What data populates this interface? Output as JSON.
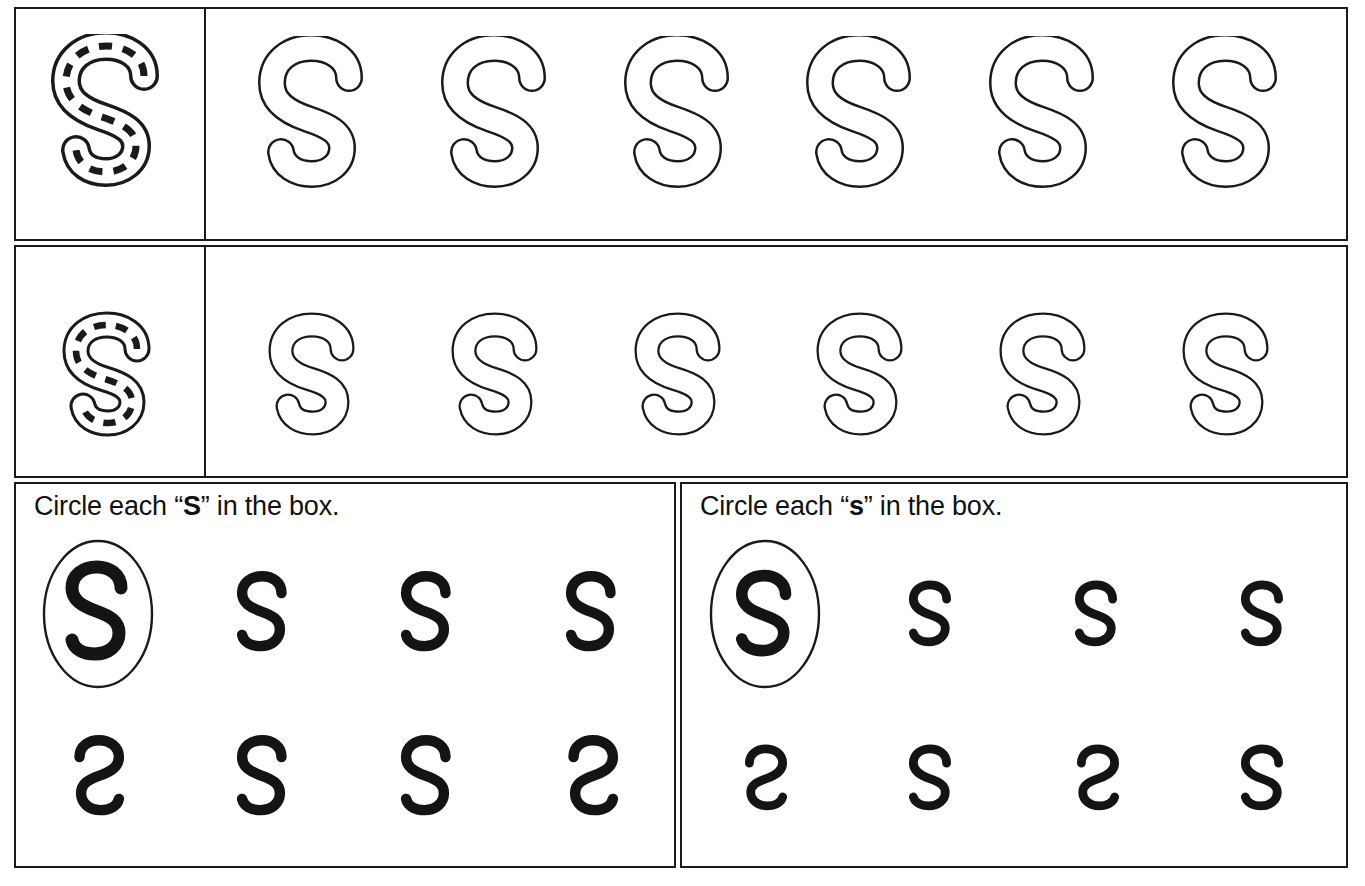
{
  "worksheet": {
    "letter_upper": "S",
    "letter_lower": "s",
    "ink_color": "#1a1a1a",
    "paper_color": "#ffffff"
  },
  "trace_rows": [
    {
      "name": "uppercase-trace-row",
      "case": "uppercase",
      "model": {
        "glyph": "S",
        "style": "dashed-guide-outline"
      },
      "practice_count": 6,
      "practice_glyph": "S",
      "practice_style": "outline"
    },
    {
      "name": "lowercase-trace-row",
      "case": "lowercase",
      "model": {
        "glyph": "s",
        "style": "dashed-guide-outline"
      },
      "practice_count": 6,
      "practice_glyph": "s",
      "practice_style": "outline"
    }
  ],
  "exercises": [
    {
      "name": "uppercase-find-exercise",
      "prompt_prefix": "Circle each “",
      "prompt_target": "S",
      "prompt_suffix": "” in the box.",
      "rows": [
        [
          {
            "glyph": "S",
            "mirrored": false,
            "circled": true,
            "size": 108
          },
          {
            "glyph": "S",
            "mirrored": false,
            "circled": false,
            "size": 84
          },
          {
            "glyph": "S",
            "mirrored": false,
            "circled": false,
            "size": 84
          },
          {
            "glyph": "S",
            "mirrored": false,
            "circled": false,
            "size": 84
          }
        ],
        [
          {
            "glyph": "S",
            "mirrored": true,
            "circled": false,
            "size": 84
          },
          {
            "glyph": "S",
            "mirrored": false,
            "circled": false,
            "size": 84
          },
          {
            "glyph": "S",
            "mirrored": false,
            "circled": false,
            "size": 84
          },
          {
            "glyph": "S",
            "mirrored": true,
            "circled": false,
            "size": 84
          }
        ]
      ]
    },
    {
      "name": "lowercase-find-exercise",
      "prompt_prefix": "Circle each “",
      "prompt_target": "s",
      "prompt_suffix": "” in the box.",
      "rows": [
        [
          {
            "glyph": "s",
            "mirrored": false,
            "circled": true,
            "size": 104
          },
          {
            "glyph": "s",
            "mirrored": false,
            "circled": false,
            "size": 76
          },
          {
            "glyph": "s",
            "mirrored": false,
            "circled": false,
            "size": 76
          },
          {
            "glyph": "s",
            "mirrored": false,
            "circled": false,
            "size": 76
          }
        ],
        [
          {
            "glyph": "s",
            "mirrored": true,
            "circled": false,
            "size": 76
          },
          {
            "glyph": "s",
            "mirrored": false,
            "circled": false,
            "size": 76
          },
          {
            "glyph": "s",
            "mirrored": true,
            "circled": false,
            "size": 76
          },
          {
            "glyph": "s",
            "mirrored": false,
            "circled": false,
            "size": 76
          }
        ]
      ]
    }
  ]
}
